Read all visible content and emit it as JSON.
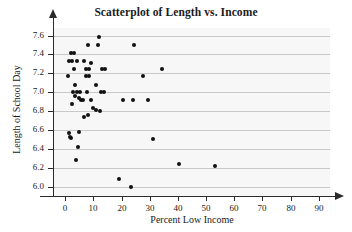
{
  "chart_data": {
    "type": "scatter",
    "title": "Scatterplot of Length vs. Income",
    "xlabel": "Percent Low Income",
    "ylabel": "Length of School Day",
    "xlim": [
      -4,
      94
    ],
    "ylim": [
      5.9,
      7.68
    ],
    "grid": true,
    "legend": null,
    "xticks": [
      0,
      10,
      20,
      30,
      40,
      50,
      60,
      70,
      80,
      90
    ],
    "xtick_labels": [
      "0",
      "10",
      "20",
      "30",
      "40",
      "50",
      "60",
      "70",
      "80",
      "90"
    ],
    "yticks": [
      6.0,
      6.2,
      6.4,
      6.6,
      6.8,
      7.0,
      7.2,
      7.4,
      7.6
    ],
    "ytick_labels": [
      "6.0",
      "6.2",
      "6.4",
      "6.6",
      "6.8",
      "7.0",
      "7.2",
      "7.4",
      "7.6"
    ],
    "marker_color": "#111111",
    "plot_background": "#f7f7f7",
    "gridline_color": "#c9c9c9",
    "series": [
      {
        "name": "schools",
        "points": [
          [
            12.0,
            7.58
          ],
          [
            8.0,
            7.5
          ],
          [
            11.5,
            7.5
          ],
          [
            24.5,
            7.5
          ],
          [
            2.0,
            7.42
          ],
          [
            3.2,
            7.42
          ],
          [
            1.2,
            7.33
          ],
          [
            2.2,
            7.33
          ],
          [
            4.3,
            7.33
          ],
          [
            6.5,
            7.33
          ],
          [
            9.2,
            7.31
          ],
          [
            3.0,
            7.25
          ],
          [
            7.5,
            7.25
          ],
          [
            8.3,
            7.25
          ],
          [
            13.0,
            7.25
          ],
          [
            14.2,
            7.25
          ],
          [
            34.5,
            7.25
          ],
          [
            1.0,
            7.17
          ],
          [
            7.3,
            7.17
          ],
          [
            8.5,
            7.17
          ],
          [
            27.5,
            7.17
          ],
          [
            3.5,
            7.08
          ],
          [
            11.0,
            7.08
          ],
          [
            2.6,
            7.0
          ],
          [
            4.0,
            7.0
          ],
          [
            5.2,
            7.0
          ],
          [
            7.8,
            7.0
          ],
          [
            12.8,
            7.0
          ],
          [
            13.8,
            7.0
          ],
          [
            3.6,
            6.96
          ],
          [
            5.0,
            6.94
          ],
          [
            5.4,
            6.92
          ],
          [
            6.2,
            6.92
          ],
          [
            9.0,
            6.92
          ],
          [
            20.5,
            6.92
          ],
          [
            24.0,
            6.92
          ],
          [
            29.5,
            6.92
          ],
          [
            2.5,
            6.87
          ],
          [
            10.0,
            6.83
          ],
          [
            11.0,
            6.81
          ],
          [
            12.3,
            6.8
          ],
          [
            8.0,
            6.76
          ],
          [
            6.5,
            6.74
          ],
          [
            1.3,
            6.57
          ],
          [
            4.8,
            6.58
          ],
          [
            1.5,
            6.53
          ],
          [
            2.0,
            6.52
          ],
          [
            4.5,
            6.42
          ],
          [
            31.0,
            6.5
          ],
          [
            3.8,
            6.28
          ],
          [
            40.5,
            6.24
          ],
          [
            53.0,
            6.22
          ],
          [
            19.0,
            6.08
          ],
          [
            23.5,
            6.0
          ]
        ]
      }
    ]
  }
}
